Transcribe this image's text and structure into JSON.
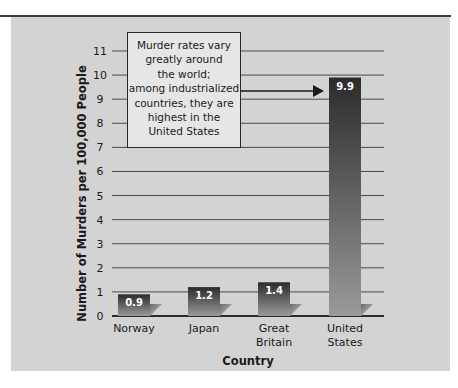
{
  "chart_data": {
    "type": "bar",
    "title": "",
    "annotation": {
      "lines": [
        "Murder rates vary",
        "greatly around",
        "the world;",
        "among industrialized",
        "countries, they are",
        "highest in the",
        "United States"
      ],
      "arrow_target": "United States"
    },
    "categories": [
      "Norway",
      "Japan",
      "Great Britain",
      "United States"
    ],
    "category_label_lines": [
      [
        "Norway"
      ],
      [
        "Japan"
      ],
      [
        "Great",
        "Britain"
      ],
      [
        "United",
        "States"
      ]
    ],
    "values": [
      0.9,
      1.2,
      1.4,
      9.9
    ],
    "value_labels": [
      "0.9",
      "1.2",
      "1.4",
      "9.9"
    ],
    "xlabel": "Country",
    "ylabel": "Number of Murders per 100,000 People",
    "ylim": [
      0,
      11
    ],
    "yticks": [
      0,
      1,
      2,
      3,
      4,
      5,
      6,
      7,
      8,
      9,
      10,
      11
    ],
    "ytick_labels": [
      "0",
      "1",
      "2",
      "3",
      "4",
      "5",
      "6",
      "7",
      "8",
      "9",
      "10",
      "11"
    ],
    "grid": true,
    "legend": null,
    "colors": {
      "panel": "#d3d3d3",
      "bar_top": "#2b2b2b",
      "bar_bottom": "#9a9a9a",
      "gridline": "#4a4a4a"
    }
  }
}
